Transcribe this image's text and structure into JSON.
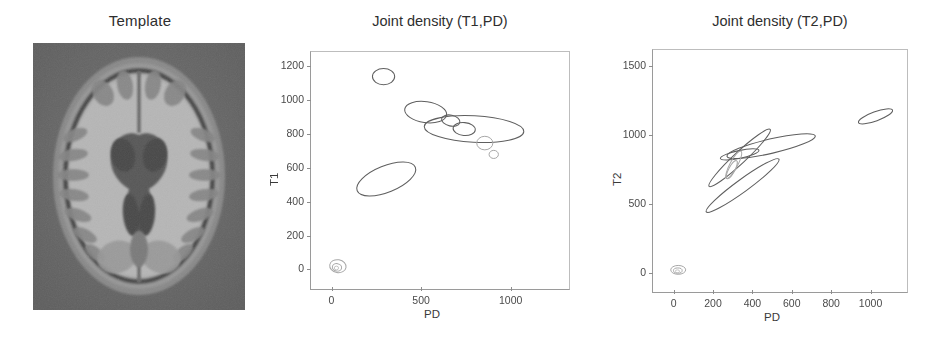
{
  "figure": {
    "panels": [
      "Template",
      "Joint density (T1,PD)",
      "Joint density (T2,PD)"
    ]
  },
  "template_panel": {
    "title": "Template",
    "image_alt": "axial-brain-mri-slice"
  },
  "chart_data": [
    {
      "type": "scatter",
      "title": "Joint density (T1,PD)",
      "xlabel": "PD",
      "ylabel": "T1",
      "xlim": [
        -120,
        1320
      ],
      "ylim": [
        -110,
        1290
      ],
      "xticks": [
        0,
        500,
        1000
      ],
      "yticks": [
        0,
        200,
        400,
        600,
        800,
        1000,
        1200
      ],
      "grid": false,
      "legend": null,
      "annotation": "Gaussian mixture components drawn as 1-sigma covariance ellipses",
      "ellipses": [
        {
          "label": "c1",
          "cx": 285,
          "cy": 1145,
          "rx": 62,
          "ry": 48,
          "angle": 0,
          "shade": "normal"
        },
        {
          "label": "c2",
          "cx": 520,
          "cy": 935,
          "rx": 118,
          "ry": 62,
          "angle": -8,
          "shade": "normal"
        },
        {
          "label": "c3",
          "cx": 660,
          "cy": 885,
          "rx": 52,
          "ry": 32,
          "angle": -12,
          "shade": "normal"
        },
        {
          "label": "c4",
          "cx": 790,
          "cy": 835,
          "rx": 278,
          "ry": 78,
          "angle": -3,
          "shade": "normal"
        },
        {
          "label": "c5",
          "cx": 735,
          "cy": 835,
          "rx": 62,
          "ry": 38,
          "angle": -5,
          "shade": "normal"
        },
        {
          "label": "c6",
          "cx": 850,
          "cy": 752,
          "rx": 45,
          "ry": 40,
          "angle": 0,
          "shade": "faint"
        },
        {
          "label": "c7",
          "cx": 900,
          "cy": 685,
          "rx": 26,
          "ry": 24,
          "angle": 0,
          "shade": "faint"
        },
        {
          "label": "c8",
          "cx": 300,
          "cy": 540,
          "rx": 175,
          "ry": 78,
          "angle": 22,
          "shade": "normal"
        },
        {
          "label": "c9",
          "cx": 30,
          "cy": 25,
          "rx": 46,
          "ry": 38,
          "angle": -10,
          "shade": "faint"
        },
        {
          "label": "c10",
          "cx": 25,
          "cy": 18,
          "rx": 26,
          "ry": 22,
          "angle": -10,
          "shade": "faint"
        },
        {
          "label": "c11",
          "cx": 22,
          "cy": 14,
          "rx": 12,
          "ry": 11,
          "angle": 0,
          "shade": "vfaint"
        }
      ]
    },
    {
      "type": "scatter",
      "title": "Joint density (T2,PD)",
      "xlabel": "PD",
      "ylabel": "T2",
      "xlim": [
        -110,
        1180
      ],
      "ylim": [
        -130,
        1620
      ],
      "xticks": [
        0,
        200,
        400,
        600,
        800,
        1000
      ],
      "yticks": [
        0,
        500,
        1000,
        1500
      ],
      "grid": false,
      "legend": null,
      "annotation": "Gaussian mixture components drawn as 1-sigma covariance ellipses",
      "ellipses": [
        {
          "label": "d1",
          "cx": 1020,
          "cy": 1140,
          "rx": 92,
          "ry": 33,
          "angle": 20,
          "shade": "normal"
        },
        {
          "label": "d2",
          "cx": 490,
          "cy": 925,
          "rx": 230,
          "ry": 52,
          "angle": 13,
          "shade": "normal"
        },
        {
          "label": "d3",
          "cx": 330,
          "cy": 840,
          "rx": 212,
          "ry": 42,
          "angle": 43,
          "shade": "normal"
        },
        {
          "label": "d4",
          "cx": 330,
          "cy": 865,
          "rx": 100,
          "ry": 28,
          "angle": 12,
          "shade": "normal"
        },
        {
          "label": "d5",
          "cx": 300,
          "cy": 790,
          "rx": 78,
          "ry": 28,
          "angle": 62,
          "shade": "faint"
        },
        {
          "label": "d6",
          "cx": 290,
          "cy": 755,
          "rx": 52,
          "ry": 22,
          "angle": 62,
          "shade": "faint"
        },
        {
          "label": "d7",
          "cx": 345,
          "cy": 640,
          "rx": 228,
          "ry": 45,
          "angle": 36,
          "shade": "normal"
        },
        {
          "label": "d8",
          "cx": 18,
          "cy": 30,
          "rx": 38,
          "ry": 32,
          "angle": 0,
          "shade": "faint"
        },
        {
          "label": "d9",
          "cx": 16,
          "cy": 25,
          "rx": 22,
          "ry": 19,
          "angle": 0,
          "shade": "faint"
        },
        {
          "label": "d10",
          "cx": 14,
          "cy": 20,
          "rx": 11,
          "ry": 10,
          "angle": 0,
          "shade": "vfaint"
        }
      ]
    }
  ]
}
